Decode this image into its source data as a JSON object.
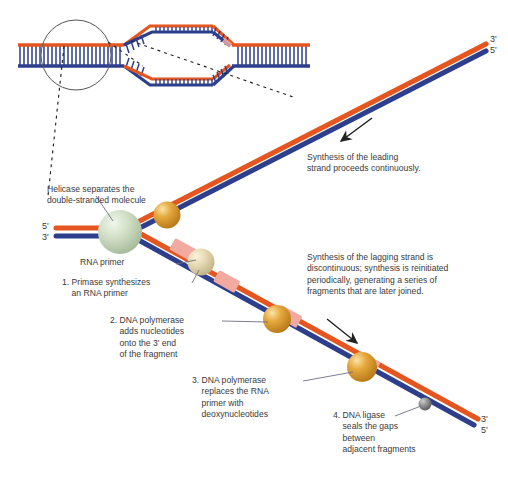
{
  "figure": {
    "colors": {
      "leading_strand_orange": "#E4551F",
      "lagging_strand_blue": "#2D3E8C",
      "rna_primer_pink": "#F2A9A0",
      "helicase_green": "#C6D6BC",
      "polymerase_orange": "#E0A13A",
      "primase_cream": "#E6D9B4",
      "ligase_gray": "#8C8C8C",
      "text_gray": "#3A3A3A",
      "leader_line": "#6E6E84"
    }
  },
  "inset": {
    "name": "replication-bubble-inset",
    "description": "double-stranded DNA with a replication bubble, circled region magnified below"
  },
  "end_labels": {
    "fork_left_top": "5'",
    "fork_left_bottom": "3'",
    "top_right_upper": "3'",
    "top_right_lower": "5'",
    "bottom_right_upper": "3'",
    "bottom_right_lower": "5'"
  },
  "annotations": {
    "helicase": {
      "lines": [
        "Helicase separates the",
        "double-stranded molecule"
      ],
      "text": "Helicase separates the\ndouble-stranded molecule"
    },
    "rna_primer": {
      "text": "RNA primer"
    },
    "step1": {
      "lines": [
        "1. Primase synthesizes",
        "    an RNA primer"
      ],
      "text": "1. Primase synthesizes\n    an RNA primer"
    },
    "step2": {
      "lines": [
        "2. DNA polymerase",
        "    adds nucleotides",
        "    onto the 3' end",
        "    of the fragment"
      ],
      "text": "2. DNA polymerase\n    adds nucleotides\n    onto the 3' end\n    of the fragment"
    },
    "step3": {
      "lines": [
        "3. DNA polymerase",
        "    replaces the RNA",
        "    primer with",
        "    deoxynucleotides"
      ],
      "text": "3. DNA polymerase\n    replaces the RNA\n    primer with\n    deoxynucleotides"
    },
    "step4": {
      "lines": [
        "4. DNA ligase",
        "    seals the gaps",
        "    between",
        "    adjacent fragments"
      ],
      "text": "4. DNA ligase\n    seals the gaps\n    between\n    adjacent fragments"
    },
    "leading_note": {
      "lines": [
        "Synthesis of the leading",
        "strand proceeds continuously."
      ],
      "text": "Synthesis of the leading\nstrand proceeds continuously."
    },
    "lagging_note": {
      "lines": [
        "Synthesis of the lagging strand is",
        "discontinuous; synthesis is reinitiated",
        "periodically, generating a series of",
        "fragments that are later joined."
      ],
      "text": "Synthesis of the lagging strand is\ndiscontinuous; synthesis is reinitiated\nperiodically, generating a series of\nfragments that are later joined."
    }
  },
  "proteins": [
    {
      "name": "helicase",
      "label": "Helicase",
      "color": "#C6D6BC"
    },
    {
      "name": "dna-polymerase-leading",
      "label": "DNA polymerase",
      "color": "#E0A13A"
    },
    {
      "name": "primase",
      "label": "Primase",
      "color": "#E6D9B4"
    },
    {
      "name": "dna-polymerase-lagging-1",
      "label": "DNA polymerase",
      "color": "#E0A13A"
    },
    {
      "name": "dna-polymerase-lagging-2",
      "label": "DNA polymerase",
      "color": "#E0A13A"
    },
    {
      "name": "dna-ligase",
      "label": "DNA ligase",
      "color": "#8C8C8C"
    }
  ],
  "arrows": [
    {
      "name": "leading-direction-arrow",
      "direction": "down-left"
    },
    {
      "name": "lagging-direction-arrow",
      "direction": "down-right"
    }
  ]
}
